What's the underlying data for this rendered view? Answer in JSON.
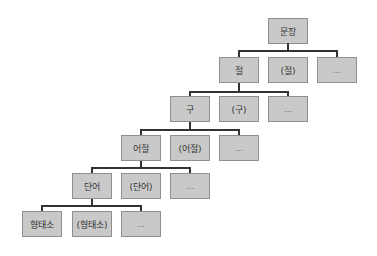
{
  "diagram": {
    "type": "hierarchy",
    "levels": [
      {
        "nodes": [
          "문장"
        ]
      },
      {
        "nodes": [
          "절",
          "(절)",
          "…"
        ]
      },
      {
        "nodes": [
          "구",
          "(구)",
          "…"
        ]
      },
      {
        "nodes": [
          "어절",
          "(어절)",
          "…"
        ]
      },
      {
        "nodes": [
          "단어",
          "(단어)",
          "…"
        ]
      },
      {
        "nodes": [
          "형태소",
          "(형태소)",
          "…"
        ]
      }
    ]
  },
  "colors": {
    "box_fill": "#c9c9c9",
    "box_border": "#8f8f8f",
    "connector": "#333333"
  }
}
